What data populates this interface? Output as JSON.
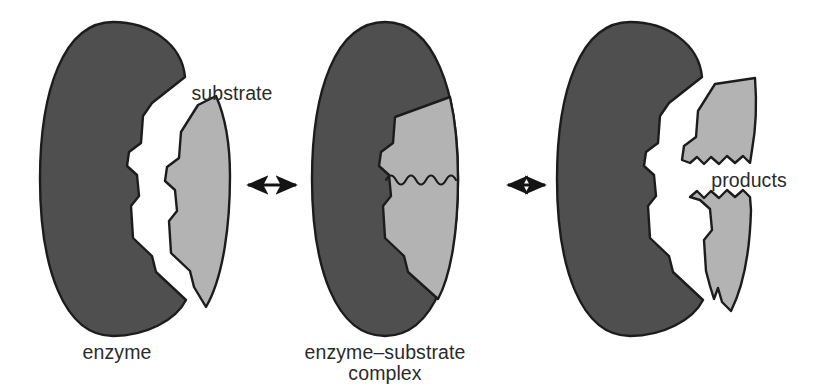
{
  "figure": {
    "background_color": "#ffffff",
    "width": 821,
    "height": 388
  },
  "colors": {
    "enzyme_fill": "#4f4f4f",
    "substrate_fill": "#b3b3b3",
    "outline": "#1c1c1c",
    "text": "#2b2b2b",
    "arrow": "#141414",
    "background": "#ffffff"
  },
  "labels": {
    "enzyme": "enzyme",
    "substrate": "substrate",
    "complex_line1": "enzyme–substrate",
    "complex_line2": "complex",
    "products": "products"
  },
  "panels": [
    {
      "id": "panel-left",
      "name": "free-enzyme-and-substrate",
      "caption": "enzyme",
      "secondary_caption": "substrate",
      "shapes": [
        "enzyme",
        "substrate"
      ]
    },
    {
      "id": "panel-middle",
      "name": "enzyme-substrate-complex",
      "caption": "enzyme–substrate complex",
      "shapes": [
        "enzyme",
        "substrate",
        "scissile-bond"
      ]
    },
    {
      "id": "panel-right",
      "name": "enzyme-and-products",
      "caption": "products",
      "shapes": [
        "enzyme",
        "product-upper",
        "product-lower"
      ]
    }
  ],
  "arrows": [
    {
      "id": "arrow-1",
      "name": "reversible-arrow-left",
      "direction": "bidirectional",
      "from": "panel-left",
      "to": "panel-middle"
    },
    {
      "id": "arrow-2",
      "name": "reversible-arrow-right",
      "direction": "bidirectional",
      "from": "panel-middle",
      "to": "panel-right"
    }
  ],
  "geometry": {
    "enzyme_left": {
      "path": "M 113 22 C 150 22 182 44 185 77 L 152 103 L 143 116 L 141 143 L 129 152 L 127 166 L 137 175 L 139 196 L 131 206 L 133 238 L 152 256 L 156 272 L 186 300 C 176 320 146 336 113 336 C 64 336 40 268 40 179 C 40 90 64 22 113 22 Z"
    },
    "substrate_left": {
      "path": "M 198 105 L 181 132 L 179 158 L 167 167 L 165 181 L 175 190 L 177 211 L 169 221 L 171 253 L 190 271 L 194 287 L 206 307 C 224 276 230 222 230 176 C 230 138 224 114 216 96 Z"
    },
    "enzyme_middle": {
      "path": "M 385 22 C 434 22 458 90 458 179 C 458 268 434 336 385 336 C 336 336 312 268 312 179 C 312 90 336 22 385 22 Z"
    },
    "substrate_middle": {
      "path": "M 450 97 L 395 117 L 393 143 L 381 152 L 379 166 L 389 175 L 391 196 L 383 206 L 385 238 L 404 256 L 408 272 L 438 299 C 451 275 458 231 458 179 C 458 147 455 119 450 97 Z"
    },
    "enzyme_right": {
      "path": "M 630 22 C 667 22 699 44 702 77 L 669 103 L 660 116 L 658 143 L 646 152 L 644 166 L 654 175 L 656 196 L 648 206 L 650 238 L 669 256 L 673 272 L 703 300 C 693 320 663 336 630 336 C 581 336 557 268 557 179 C 557 90 581 22 630 22 Z"
    },
    "product_upper": {
      "path": "M 715 84 L 698 111 L 696 137 L 684 146 L 682 160 L 690 163 L 697 157 L 704 164 L 711 157 L 719 164 L 727 156 L 735 163 L 743 156 L 750 163 L 752 150 C 756 128 757 104 755 78 Z"
    },
    "product_lower": {
      "path": "M 690 197 L 697 191 L 704 198 L 711 191 L 719 198 L 727 190 L 735 197 L 743 190 L 750 197 L 751 210 C 750 248 744 285 731 311 L 722 302 L 718 288 L 714 299 L 710 286 L 706 271 L 704 240 L 712 230 L 710 209 L 700 200 Z"
    },
    "scissile_bond": {
      "description": "wavy line marking the bond cleaved in the complex",
      "path": "M 386 180 q 5 -9 10 0 q 5 9 10 0 q 5 -9 10 0 q 5 9 10 0 q 5 -9 10 0 q 5 9 10 0 q 5 -9 10 0"
    },
    "arrow_1": {
      "x1": 240,
      "x2": 303,
      "y": 185
    },
    "arrow_2": {
      "x1": 500,
      "x2": 552,
      "y": 185
    }
  },
  "label_positions": {
    "enzyme": {
      "x": 117,
      "y": 359
    },
    "substrate": {
      "x": 232,
      "y": 100
    },
    "complex_line1": {
      "x": 385,
      "y": 359
    },
    "complex_line2": {
      "x": 385,
      "y": 380
    },
    "products": {
      "x": 749,
      "y": 187
    }
  }
}
